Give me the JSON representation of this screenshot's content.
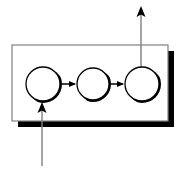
{
  "canvas": {
    "width": 184,
    "height": 171,
    "background_color": "#ffffff",
    "title": "Three-stage process flow diagram"
  },
  "palette": {
    "stroke": "#000000",
    "shadow": "#000000",
    "box_stroke": "#808080",
    "fill": "#ffffff",
    "thin_line": "#7f7f7f"
  },
  "container_box": {
    "name": "system-boundary-box",
    "x": 12,
    "y": 45,
    "width": 156,
    "height": 76,
    "stroke_color": "#808080",
    "fill_color": "#ffffff",
    "shadow_offset": 6,
    "shadow_color": "#000000"
  },
  "nodes": [
    {
      "id": "node-1",
      "name": "process-node-1",
      "label": "",
      "cx": 43,
      "cy": 84,
      "r": 17,
      "fill_color": "#ffffff",
      "stroke_color": "#000000",
      "shadow_color": "#000000"
    },
    {
      "id": "node-2",
      "name": "process-node-2",
      "label": "",
      "cx": 93,
      "cy": 84,
      "r": 16,
      "fill_color": "#ffffff",
      "stroke_color": "#000000",
      "shadow_color": "#000000"
    },
    {
      "id": "node-3",
      "name": "process-node-3",
      "label": "",
      "cx": 142,
      "cy": 84,
      "r": 17,
      "fill_color": "#ffffff",
      "stroke_color": "#000000",
      "shadow_color": "#000000"
    }
  ],
  "connector_arrows": [
    {
      "id": "connector-1-2",
      "name": "connector-arrow-node1-node2",
      "label": "",
      "x1": 62,
      "y1": 84,
      "x2": 76,
      "y2": 84,
      "color": "#000000"
    },
    {
      "id": "connector-2-3",
      "name": "connector-arrow-node2-node3",
      "label": "",
      "x1": 110,
      "y1": 84,
      "x2": 124,
      "y2": 84,
      "color": "#000000"
    }
  ],
  "external_arrows": [
    {
      "id": "input-arrow",
      "name": "input-arrow-bottom",
      "label": "",
      "direction": "up",
      "x": 42,
      "y_start": 166,
      "y_end": 103,
      "color": "#7f7f7f",
      "head_color": "#000000"
    },
    {
      "id": "output-arrow",
      "name": "output-arrow-top",
      "label": "",
      "direction": "up",
      "x": 141,
      "y_start": 66,
      "y_end": 7,
      "color": "#7f7f7f",
      "head_color": "#000000"
    }
  ]
}
